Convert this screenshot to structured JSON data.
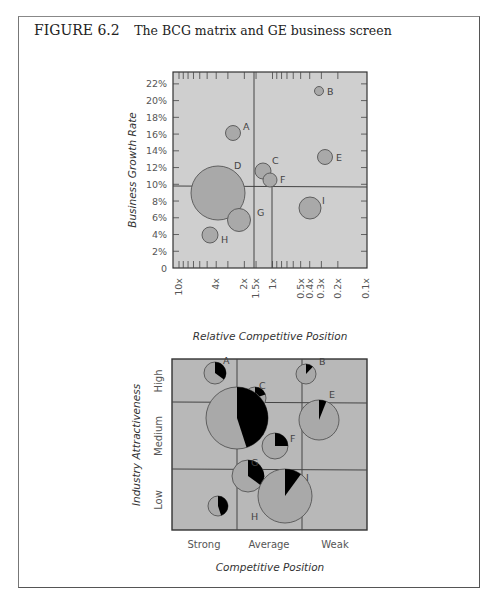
{
  "figure": {
    "number": "FIGURE 6.2",
    "caption": "The BCG matrix and GE business screen"
  },
  "colors": {
    "plot_bg": "#cfcfcf",
    "ge_bg": "#b8b8b8",
    "bubble_fill": "#a9a9a9",
    "bubble_stroke": "#555555",
    "pie_slice": "#000000",
    "grid_line": "#444444"
  },
  "chart_data": [
    {
      "type": "scatter",
      "subtype": "bubble",
      "title": "BCG matrix",
      "xlabel": "Relative Competitive Position",
      "ylabel": "Business Growth Rate",
      "x_scale": "log, reversed",
      "x_ticks": [
        "10x",
        "4x",
        "2x",
        "1.5x",
        "1x",
        "0.5x",
        "0.4x",
        "0.3x",
        "0.2x",
        "0.1x"
      ],
      "y_ticks": [
        "0",
        "2%",
        "4%",
        "6%",
        "8%",
        "10%",
        "12%",
        "14%",
        "16%",
        "18%",
        "20%",
        "22%"
      ],
      "ylim": [
        0,
        23
      ],
      "dividers": {
        "x": [
          "1.5x",
          "1x"
        ],
        "y": "10%"
      },
      "points": [
        {
          "label": "A",
          "x": 2.4,
          "y": 16.2,
          "size": 8
        },
        {
          "label": "B",
          "x": 0.33,
          "y": 21.2,
          "size": 5
        },
        {
          "label": "C",
          "x": 1.2,
          "y": 11.8,
          "size": 8
        },
        {
          "label": "D",
          "x": 3.6,
          "y": 9.0,
          "size": 28
        },
        {
          "label": "E",
          "x": 0.3,
          "y": 13.4,
          "size": 8
        },
        {
          "label": "F",
          "x": 1.05,
          "y": 10.7,
          "size": 8
        },
        {
          "label": "G",
          "x": 1.9,
          "y": 5.9,
          "size": 12
        },
        {
          "label": "H",
          "x": 4.3,
          "y": 4.1,
          "size": 8
        },
        {
          "label": "I",
          "x": 0.42,
          "y": 7.1,
          "size": 12
        }
      ]
    },
    {
      "type": "scatter",
      "subtype": "pie-bubble",
      "title": "GE business screen",
      "xlabel": "Competitive Position",
      "ylabel": "Industry Attractiveness",
      "x_categories": [
        "Strong",
        "Average",
        "Weak"
      ],
      "y_categories": [
        "High",
        "Medium",
        "Low"
      ],
      "points": [
        {
          "label": "A",
          "cx": 215,
          "cy": 373,
          "r": 11,
          "share": 0.35
        },
        {
          "label": "B",
          "cx": 306,
          "cy": 374,
          "r": 10,
          "share": 0.12
        },
        {
          "label": "C",
          "cx": 255,
          "cy": 398,
          "r": 11,
          "share": 0.2
        },
        {
          "label": "D",
          "cx": 237,
          "cy": 418,
          "r": 31,
          "share": 0.45
        },
        {
          "label": "E",
          "cx": 319,
          "cy": 420,
          "r": 20,
          "share": 0.06
        },
        {
          "label": "F",
          "cx": 275,
          "cy": 446,
          "r": 13,
          "share": 0.25
        },
        {
          "label": "G",
          "cx": 248,
          "cy": 476,
          "r": 16,
          "share": 0.35
        },
        {
          "label": "H",
          "cx": 218,
          "cy": 506,
          "r": 10,
          "share": 0.45
        },
        {
          "label": "I",
          "cx": 285,
          "cy": 496,
          "r": 27,
          "share": 0.1
        }
      ]
    }
  ]
}
